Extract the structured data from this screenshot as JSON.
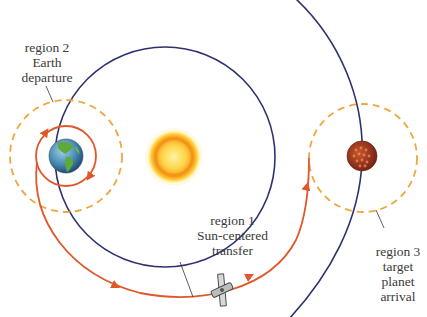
{
  "diagram": {
    "type": "interplanetary-trajectory",
    "colors": {
      "earth_orbit": "#2e3170",
      "target_orbit": "#2e3170",
      "transfer_path": "#e0572a",
      "sphere_of_influence": "#f0a640",
      "sun_core": "#ffe066",
      "sun_rim": "#f59a1a",
      "planet": "#a0391f",
      "text": "#3a3a3a"
    },
    "labels": {
      "region2": {
        "line1": "region 2",
        "line2": "Earth",
        "line3": "departure"
      },
      "region1": {
        "line1": "region 1",
        "line2": "Sun-centered",
        "line3": "transfer"
      },
      "region3": {
        "line1": "region 3",
        "line2": "target",
        "line3": "planet",
        "line4": "arrival"
      }
    },
    "objects": {
      "sun": "sun-icon",
      "earth": "earth-globe-icon",
      "target_planet": "planet-icon",
      "spacecraft": "spacecraft-icon"
    }
  }
}
